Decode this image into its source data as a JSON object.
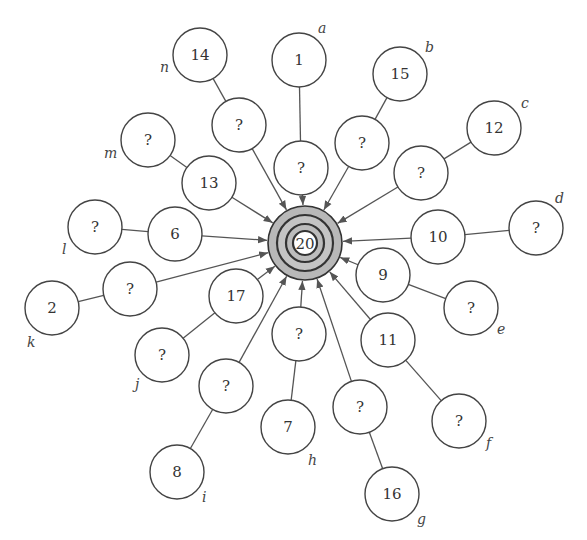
{
  "diagram": {
    "type": "hub-and-spoke graph",
    "hub": {
      "id": "hub",
      "label": "20",
      "x": 305,
      "y": 243,
      "rings": [
        37,
        28,
        19,
        12
      ],
      "fill": "#bdbdbd"
    },
    "node_radius": 27,
    "nodes": [
      {
        "id": "n14",
        "label": "14",
        "x": 200,
        "y": 55
      },
      {
        "id": "n1",
        "label": "1",
        "x": 299,
        "y": 60
      },
      {
        "id": "n15",
        "label": "15",
        "x": 400,
        "y": 74
      },
      {
        "id": "n12",
        "label": "12",
        "x": 494,
        "y": 128
      },
      {
        "id": "nd",
        "label": "?",
        "x": 536,
        "y": 228
      },
      {
        "id": "inb",
        "label": "?",
        "x": 362,
        "y": 143
      },
      {
        "id": "ina",
        "label": "?",
        "x": 301,
        "y": 168
      },
      {
        "id": "inn",
        "label": "?",
        "x": 239,
        "y": 125
      },
      {
        "id": "nm",
        "label": "?",
        "x": 148,
        "y": 140
      },
      {
        "id": "n13",
        "label": "13",
        "x": 209,
        "y": 183
      },
      {
        "id": "nl",
        "label": "?",
        "x": 95,
        "y": 227
      },
      {
        "id": "n6",
        "label": "6",
        "x": 175,
        "y": 234
      },
      {
        "id": "inc",
        "label": "?",
        "x": 421,
        "y": 173
      },
      {
        "id": "n10",
        "label": "10",
        "x": 438,
        "y": 237
      },
      {
        "id": "n9",
        "label": "9",
        "x": 383,
        "y": 275
      },
      {
        "id": "ne",
        "label": "?",
        "x": 471,
        "y": 308
      },
      {
        "id": "n11",
        "label": "11",
        "x": 388,
        "y": 340
      },
      {
        "id": "nf",
        "label": "?",
        "x": 459,
        "y": 421
      },
      {
        "id": "n2",
        "label": "2",
        "x": 52,
        "y": 308
      },
      {
        "id": "ink",
        "label": "?",
        "x": 130,
        "y": 289
      },
      {
        "id": "n17",
        "label": "17",
        "x": 236,
        "y": 296
      },
      {
        "id": "nj",
        "label": "?",
        "x": 162,
        "y": 355
      },
      {
        "id": "ini",
        "label": "?",
        "x": 226,
        "y": 386
      },
      {
        "id": "n8",
        "label": "8",
        "x": 177,
        "y": 472
      },
      {
        "id": "inh",
        "label": "?",
        "x": 299,
        "y": 334
      },
      {
        "id": "n7",
        "label": "7",
        "x": 288,
        "y": 427
      },
      {
        "id": "ing",
        "label": "?",
        "x": 360,
        "y": 407
      },
      {
        "id": "n16",
        "label": "16",
        "x": 392,
        "y": 494
      }
    ],
    "edges_to_hub": [
      "inn",
      "ina",
      "inb",
      "inc",
      "n13",
      "n6",
      "ink",
      "n17",
      "ini",
      "inh",
      "ing",
      "n11",
      "n9",
      "n10"
    ],
    "plain_edges": [
      [
        "n14",
        "inn"
      ],
      [
        "n1",
        "ina"
      ],
      [
        "n15",
        "inb"
      ],
      [
        "n12",
        "inc"
      ],
      [
        "nd",
        "n10"
      ],
      [
        "nm",
        "n13"
      ],
      [
        "nl",
        "n6"
      ],
      [
        "n2",
        "ink"
      ],
      [
        "nj",
        "n17"
      ],
      [
        "n8",
        "ini"
      ],
      [
        "n7",
        "inh"
      ],
      [
        "n16",
        "ing"
      ],
      [
        "ne",
        "n9"
      ],
      [
        "nf",
        "n11"
      ]
    ],
    "letters": [
      {
        "text": "a",
        "x": 318,
        "y": 33
      },
      {
        "text": "b",
        "x": 425,
        "y": 52
      },
      {
        "text": "c",
        "x": 521,
        "y": 108
      },
      {
        "text": "d",
        "x": 555,
        "y": 203
      },
      {
        "text": "e",
        "x": 497,
        "y": 334
      },
      {
        "text": "f",
        "x": 486,
        "y": 448
      },
      {
        "text": "g",
        "x": 417,
        "y": 524
      },
      {
        "text": "h",
        "x": 308,
        "y": 465
      },
      {
        "text": "i",
        "x": 202,
        "y": 502
      },
      {
        "text": "j",
        "x": 135,
        "y": 389
      },
      {
        "text": "k",
        "x": 27,
        "y": 347
      },
      {
        "text": "l",
        "x": 62,
        "y": 254
      },
      {
        "text": "m",
        "x": 104,
        "y": 158
      },
      {
        "text": "n",
        "x": 160,
        "y": 72
      }
    ]
  }
}
